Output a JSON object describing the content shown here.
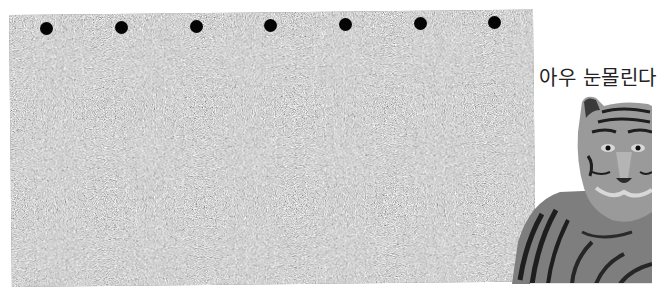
{
  "stereogram": {
    "type": "random-dot autostereogram",
    "noise_colors": [
      "#6e6e6e",
      "#c4c4c4"
    ],
    "convergence_dots": [
      {
        "x": 46,
        "y": 28
      },
      {
        "x": 121,
        "y": 27
      },
      {
        "x": 196,
        "y": 26
      },
      {
        "x": 270,
        "y": 25
      },
      {
        "x": 345,
        "y": 24
      },
      {
        "x": 420,
        "y": 23
      },
      {
        "x": 494,
        "y": 22
      }
    ],
    "dot_color": "#050505"
  },
  "caption": {
    "text": "아우 눈몰린다"
  },
  "tiger": {
    "icon": "tiger-image",
    "colors": {
      "fur": "#8a8a8a",
      "stripes": "#1e1e1e",
      "light": "#d8d8d8"
    }
  }
}
